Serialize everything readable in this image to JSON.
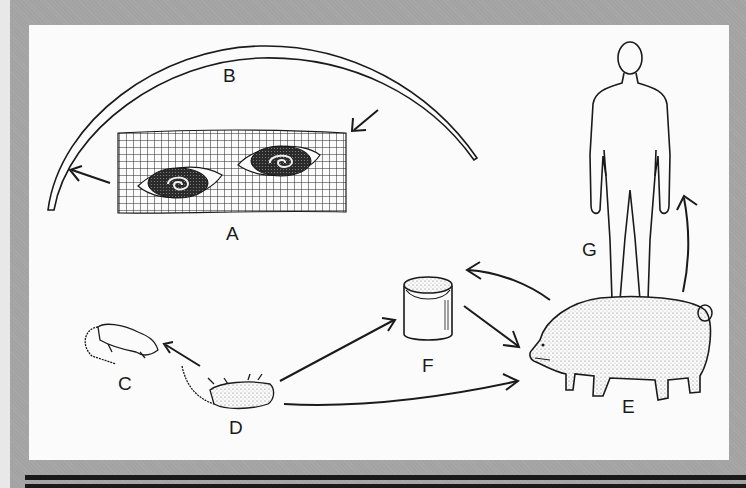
{
  "figure": {
    "type": "life-cycle diagram",
    "labels": {
      "A": "A",
      "B": "B",
      "C": "C",
      "D": "D",
      "E": "E",
      "F": "F",
      "G": "G"
    },
    "nodes": [
      {
        "id": "A",
        "depiction": "muscle tissue with encysted larvae"
      },
      {
        "id": "B",
        "depiction": "adult worm (curved)"
      },
      {
        "id": "C",
        "depiction": "rat (live)"
      },
      {
        "id": "D",
        "depiction": "rat (dead, on its back)"
      },
      {
        "id": "E",
        "depiction": "pig"
      },
      {
        "id": "F",
        "depiction": "garbage can / swill bucket"
      },
      {
        "id": "G",
        "depiction": "human"
      }
    ],
    "arrows": [
      {
        "from": "B",
        "to": "A"
      },
      {
        "from": "A",
        "to": "B"
      },
      {
        "from": "D",
        "to": "C"
      },
      {
        "from": "D",
        "to": "F"
      },
      {
        "from": "D",
        "to": "E"
      },
      {
        "from": "F",
        "to": "E"
      },
      {
        "from": "E",
        "to": "F"
      },
      {
        "from": "E",
        "to": "G"
      }
    ]
  },
  "colors": {
    "frame": "#a3a3a3",
    "panel": "#fbfbfb",
    "ink": "#1a1a1a"
  }
}
